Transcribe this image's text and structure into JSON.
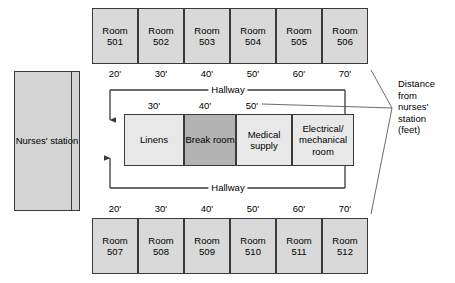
{
  "diagram": {
    "nurses_station": {
      "label_line1": "Nurses'",
      "label_line2": "station"
    },
    "hallway_label_top": "Hallway",
    "hallway_label_bottom": "Hallway",
    "annotation": {
      "line1": "Distance",
      "line2": "from",
      "line3": "nurses'",
      "line4": "station",
      "line5": "(feet)"
    },
    "top_rooms": [
      {
        "line1": "Room",
        "line2": "501",
        "distance": "20'"
      },
      {
        "line1": "Room",
        "line2": "502",
        "distance": "30'"
      },
      {
        "line1": "Room",
        "line2": "503",
        "distance": "40'"
      },
      {
        "line1": "Room",
        "line2": "504",
        "distance": "50'"
      },
      {
        "line1": "Room",
        "line2": "505",
        "distance": "60'"
      },
      {
        "line1": "Room",
        "line2": "506",
        "distance": "70'"
      }
    ],
    "bottom_rooms": [
      {
        "line1": "Room",
        "line2": "507",
        "distance": "20'"
      },
      {
        "line1": "Room",
        "line2": "508",
        "distance": "30'"
      },
      {
        "line1": "Room",
        "line2": "509",
        "distance": "40'"
      },
      {
        "line1": "Room",
        "line2": "510",
        "distance": "50'"
      },
      {
        "line1": "Room",
        "line2": "511",
        "distance": "60'"
      },
      {
        "line1": "Room",
        "line2": "512",
        "distance": "70'"
      }
    ],
    "center_rooms": [
      {
        "line1": "Linens",
        "line2": "",
        "line3": "",
        "shaded": false
      },
      {
        "line1": "Break",
        "line2": "room",
        "line3": "",
        "shaded": true
      },
      {
        "line1": "Medical",
        "line2": "supply",
        "line3": "",
        "shaded": false
      },
      {
        "line1": "Electrical/",
        "line2": "mechanical",
        "line3": "room",
        "shaded": false
      }
    ],
    "center_distances": [
      "30'",
      "40'",
      "50'"
    ],
    "colors": {
      "room_fill": "#d9d9d9",
      "center_fill": "#e8e8e8",
      "center_shaded_fill": "#b3b3b3",
      "nurses_fill": "#d4d4d4",
      "stroke": "#3a3a3a",
      "background": "#ffffff"
    }
  }
}
